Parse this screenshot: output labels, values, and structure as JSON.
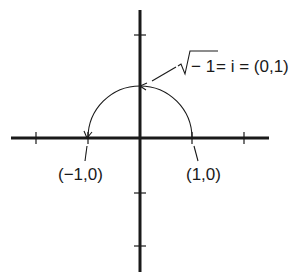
{
  "diagram": {
    "labels": {
      "i_point": "√− 1 = i = (0,1)",
      "i_radical_symbol": "√",
      "i_radicand": "− 1",
      "i_rest": " = i = (0,1)",
      "neg_one_point": "(−1,0)",
      "one_point": "(1,0)"
    },
    "axes": {
      "x_ticks": [
        -2,
        -1,
        1,
        2
      ],
      "y_ticks": [
        2,
        -2,
        -1
      ]
    },
    "arc": {
      "from": [
        1,
        0
      ],
      "via": [
        0,
        1
      ],
      "to": [
        -1,
        0
      ],
      "description": "semicircular arc of unit radius, arrows at (0,1) and (-1,0)"
    },
    "colors": {
      "ink": "#1a1a1a",
      "background": "#ffffff"
    }
  }
}
